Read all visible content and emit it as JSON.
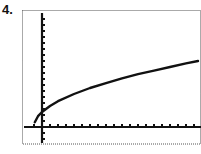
{
  "problem": {
    "label": "4."
  },
  "colors": {
    "ink": "#111111",
    "frame": "#555555",
    "background": "#ffffff"
  },
  "chart_data": {
    "type": "line",
    "title": "",
    "xlabel": "",
    "ylabel": "",
    "grid": false,
    "legend": "none",
    "x_axis_tick_count_right_of_origin": 20,
    "x_axis_tick_count_left_of_origin": 1,
    "y_axis_tick_count_above_origin": 18,
    "y_axis_tick_count_below_origin": 2,
    "series": [
      {
        "name": "curve",
        "points": [
          [
            -0.9,
            0.8
          ],
          [
            -0.5,
            1.8
          ],
          [
            0,
            2.5
          ],
          [
            1,
            3.5
          ],
          [
            2,
            4.3
          ],
          [
            4,
            5.5
          ],
          [
            6,
            6.5
          ],
          [
            8,
            7.3
          ],
          [
            10,
            8.1
          ],
          [
            12,
            8.8
          ],
          [
            14,
            9.4
          ],
          [
            16,
            10.0
          ],
          [
            18,
            10.6
          ],
          [
            19.5,
            11.0
          ]
        ]
      }
    ],
    "xlim": [
      -2.3,
      20
    ],
    "ylim": [
      -2.5,
      19
    ]
  }
}
